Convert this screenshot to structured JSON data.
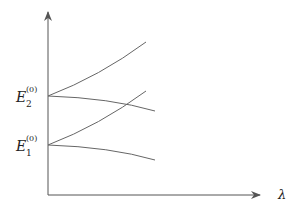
{
  "diagram": {
    "type": "energy-level perturbation diagram",
    "x_axis": {
      "label": "λ",
      "start": [
        48,
        195
      ],
      "end": [
        262,
        195
      ]
    },
    "y_axis": {
      "start": [
        48,
        195
      ],
      "end": [
        48,
        10
      ]
    },
    "levels": [
      {
        "name": "E2",
        "base": "E",
        "sub": "2",
        "sup": "(0)",
        "y": 96
      },
      {
        "name": "E1",
        "base": "E",
        "sub": "1",
        "sup": "(0)",
        "y": 145
      }
    ],
    "curves": [
      {
        "name": "E2-rising",
        "d": "M48 96 Q100 76 146 42"
      },
      {
        "name": "E2-falling",
        "d": "M48 96 Q110 98 155 111"
      },
      {
        "name": "E1-rising",
        "d": "M48 145 Q100 125 146 91"
      },
      {
        "name": "E1-falling",
        "d": "M48 145 Q110 147 155 160"
      }
    ],
    "colors": {
      "axis": "#555555",
      "curve": "#666666"
    }
  }
}
